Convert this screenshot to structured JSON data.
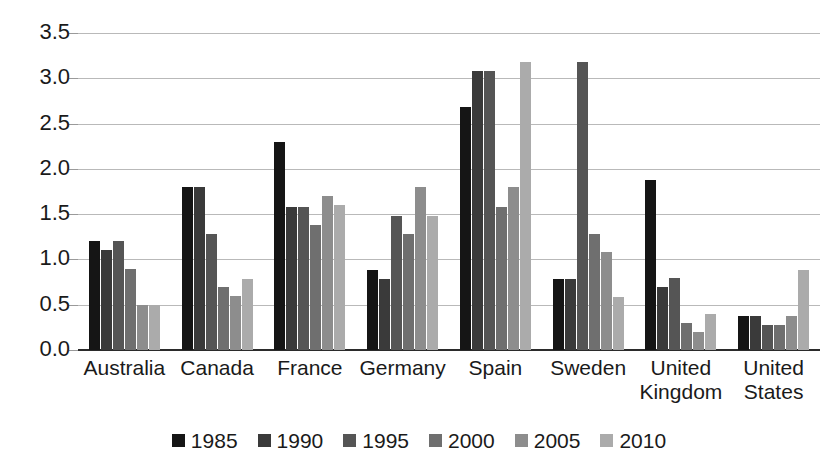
{
  "chart_data": {
    "type": "bar",
    "title": "",
    "subtitle": "",
    "xlabel": "",
    "ylabel": "",
    "ylim": [
      0.0,
      3.5
    ],
    "ytick_labels": [
      "0.0",
      "0.5",
      "1.0",
      "1.5",
      "2.0",
      "2.5",
      "3.0",
      "3.5"
    ],
    "ytick_values": [
      0.0,
      0.5,
      1.0,
      1.5,
      2.0,
      2.5,
      3.0,
      3.5
    ],
    "grid": true,
    "legend_position": "bottom",
    "categories": [
      "Australia",
      "Canada",
      "France",
      "Germany",
      "Spain",
      "Sweden",
      "United\nKingdom",
      "United\nStates"
    ],
    "series": [
      {
        "name": "1985",
        "color": "#151515",
        "values": [
          1.2,
          1.8,
          2.3,
          0.88,
          2.68,
          0.78,
          1.88,
          0.38
        ]
      },
      {
        "name": "1990",
        "color": "#3a3a3a",
        "values": [
          1.1,
          1.8,
          1.58,
          0.78,
          3.08,
          0.78,
          0.7,
          0.38
        ]
      },
      {
        "name": "1995",
        "color": "#555555",
        "values": [
          1.2,
          1.28,
          1.58,
          1.48,
          3.08,
          3.18,
          0.8,
          0.28
        ]
      },
      {
        "name": "2000",
        "color": "#6f6f6f",
        "values": [
          0.9,
          0.7,
          1.38,
          1.28,
          1.58,
          1.28,
          0.3,
          0.28
        ]
      },
      {
        "name": "2005",
        "color": "#8d8d8d",
        "values": [
          0.5,
          0.6,
          1.7,
          1.8,
          1.8,
          1.08,
          0.2,
          0.38
        ]
      },
      {
        "name": "2010",
        "color": "#ababab",
        "values": [
          0.5,
          0.78,
          1.6,
          1.48,
          3.18,
          0.58,
          0.4,
          0.88
        ]
      }
    ]
  }
}
